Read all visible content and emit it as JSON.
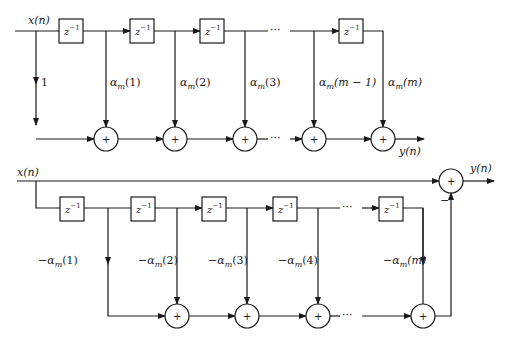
{
  "diagram": {
    "top": {
      "name": "FIR direct form (forward prediction coefficients)",
      "input_label": "x(n)",
      "output_label": "y(n)",
      "delay_label": "z",
      "delay_exp": "−1",
      "ellipsis": "···",
      "plus": "+",
      "taps": [
        "1",
        "α_m(1)",
        "α_m(2)",
        "α_m(3)",
        "α_m(m − 1)",
        "α_m(m)"
      ],
      "tap_labels": [
        {
          "pre": "",
          "coef": "1",
          "arg": ""
        },
        {
          "pre": "",
          "coef": "α",
          "sub": "m",
          "arg": "(1)"
        },
        {
          "pre": "",
          "coef": "α",
          "sub": "m",
          "arg": "(2)"
        },
        {
          "pre": "",
          "coef": "α",
          "sub": "m",
          "arg": "(3)"
        },
        {
          "pre": "",
          "coef": "α",
          "sub": "m",
          "arg": "(m − 1)"
        },
        {
          "pre": "",
          "coef": "α",
          "sub": "m",
          "arg": "(m)"
        }
      ]
    },
    "bottom": {
      "name": "Prediction error filter",
      "input_label": "x(n)",
      "output_label": "y(n)",
      "delay_label": "z",
      "delay_exp": "−1",
      "ellipsis": "···",
      "plus": "+",
      "minus_sign": "−",
      "tap_labels": [
        {
          "pre": "−",
          "coef": "α",
          "sub": "m",
          "arg": "(1)"
        },
        {
          "pre": "−",
          "coef": "α",
          "sub": "m",
          "arg": "(2)"
        },
        {
          "pre": "−",
          "coef": "α",
          "sub": "m",
          "arg": "(3)"
        },
        {
          "pre": "−",
          "coef": "α",
          "sub": "m",
          "arg": "(4)"
        },
        {
          "pre": "−",
          "coef": "α",
          "sub": "m",
          "arg": "(m)"
        }
      ]
    }
  }
}
